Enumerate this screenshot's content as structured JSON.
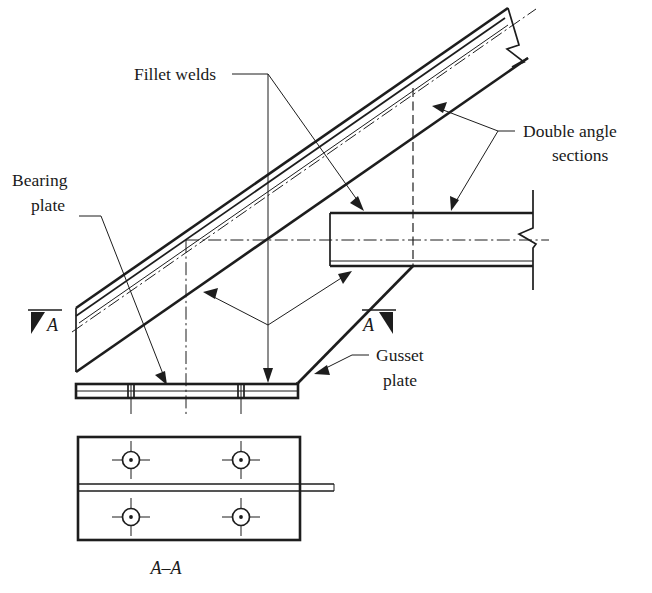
{
  "figure": {
    "section_label": "A–A",
    "width": 652,
    "height": 593,
    "background_color": "#ffffff",
    "line_color": "#1d1d1d",
    "text_color": "#1a1a1a"
  },
  "labels": {
    "fillet_welds": "Fillet welds",
    "bearing_plate_line1": "Bearing",
    "bearing_plate_line2": "plate",
    "double_angle_line1": "Double angle",
    "double_angle_line2": "sections",
    "gusset_plate_line1": "Gusset",
    "gusset_plate_line2": "plate",
    "section_marker_left": "A",
    "section_marker_right": "A",
    "section_view_caption": "A–A"
  },
  "section_view": {
    "caption": "A–A",
    "bolt_hole_count": 4,
    "bolt_holes": [
      {
        "id": "hole-top-left",
        "cx": 131,
        "cy": 460
      },
      {
        "id": "hole-top-right",
        "cx": 241,
        "cy": 460
      },
      {
        "id": "hole-bottom-left",
        "cx": 131,
        "cy": 517
      },
      {
        "id": "hole-bottom-right",
        "cx": 241,
        "cy": 517
      }
    ]
  },
  "annotations": {
    "leader_count": 6,
    "break_symbol_count": 2
  }
}
